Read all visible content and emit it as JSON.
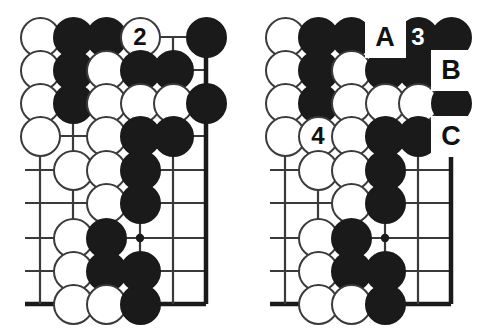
{
  "figure": {
    "type": "go-board-diagram",
    "diagram_count": 2,
    "colors": {
      "black_stone": "#1a1a1a",
      "white_stone": "#ffffff",
      "stone_outline": "#3b3b3b",
      "grid_line": "#3a3a3a",
      "edge_line": "#1a1a1a",
      "background": "#ffffff",
      "label_text": "#111111",
      "white_stone_number": "#111111",
      "black_stone_number": "#ffffff"
    },
    "geometry": {
      "columns": 6,
      "rows": 9,
      "col_x": [
        40,
        73,
        106,
        140,
        173,
        206
      ],
      "row_y": [
        37,
        70,
        103,
        136,
        170,
        203,
        238,
        271,
        304
      ],
      "stone_diameter": 41,
      "star_point": {
        "col": 4,
        "row": 7
      },
      "right_edge_col": 6,
      "bottom_edge_row": 9
    }
  },
  "boards": [
    {
      "name": "left-diagram",
      "stones": [
        {
          "col": 1,
          "row": 1,
          "color": "white",
          "label": ""
        },
        {
          "col": 2,
          "row": 1,
          "color": "black",
          "label": ""
        },
        {
          "col": 3,
          "row": 1,
          "color": "black",
          "label": ""
        },
        {
          "col": 4,
          "row": 1,
          "color": "white",
          "label": "2"
        },
        {
          "col": 6,
          "row": 1,
          "color": "black",
          "label": ""
        },
        {
          "col": 1,
          "row": 2,
          "color": "white",
          "label": ""
        },
        {
          "col": 2,
          "row": 2,
          "color": "black",
          "label": ""
        },
        {
          "col": 3,
          "row": 2,
          "color": "white",
          "label": ""
        },
        {
          "col": 4,
          "row": 2,
          "color": "black",
          "label": ""
        },
        {
          "col": 5,
          "row": 2,
          "color": "black",
          "label": ""
        },
        {
          "col": 1,
          "row": 3,
          "color": "white",
          "label": ""
        },
        {
          "col": 2,
          "row": 3,
          "color": "black",
          "label": ""
        },
        {
          "col": 3,
          "row": 3,
          "color": "white",
          "label": ""
        },
        {
          "col": 4,
          "row": 3,
          "color": "white",
          "label": ""
        },
        {
          "col": 5,
          "row": 3,
          "color": "white",
          "label": ""
        },
        {
          "col": 6,
          "row": 3,
          "color": "black",
          "label": ""
        },
        {
          "col": 1,
          "row": 4,
          "color": "white",
          "label": ""
        },
        {
          "col": 3,
          "row": 4,
          "color": "white",
          "label": ""
        },
        {
          "col": 4,
          "row": 4,
          "color": "black",
          "label": ""
        },
        {
          "col": 5,
          "row": 4,
          "color": "black",
          "label": ""
        },
        {
          "col": 2,
          "row": 5,
          "color": "white",
          "label": ""
        },
        {
          "col": 3,
          "row": 5,
          "color": "white",
          "label": ""
        },
        {
          "col": 4,
          "row": 5,
          "color": "black",
          "label": ""
        },
        {
          "col": 3,
          "row": 6,
          "color": "white",
          "label": ""
        },
        {
          "col": 4,
          "row": 6,
          "color": "black",
          "label": ""
        },
        {
          "col": 2,
          "row": 7,
          "color": "white",
          "label": ""
        },
        {
          "col": 3,
          "row": 7,
          "color": "black",
          "label": ""
        },
        {
          "col": 2,
          "row": 8,
          "color": "white",
          "label": ""
        },
        {
          "col": 3,
          "row": 8,
          "color": "black",
          "label": ""
        },
        {
          "col": 4,
          "row": 8,
          "color": "black",
          "label": ""
        },
        {
          "col": 2,
          "row": 9,
          "color": "white",
          "label": ""
        },
        {
          "col": 3,
          "row": 9,
          "color": "white",
          "label": ""
        },
        {
          "col": 4,
          "row": 9,
          "color": "black",
          "label": ""
        }
      ],
      "point_labels": []
    },
    {
      "name": "right-diagram",
      "stones": [
        {
          "col": 1,
          "row": 1,
          "color": "white",
          "label": ""
        },
        {
          "col": 2,
          "row": 1,
          "color": "black",
          "label": ""
        },
        {
          "col": 3,
          "row": 1,
          "color": "black",
          "label": ""
        },
        {
          "col": 5,
          "row": 1,
          "color": "black",
          "label": "3"
        },
        {
          "col": 6,
          "row": 1,
          "color": "black",
          "label": ""
        },
        {
          "col": 1,
          "row": 2,
          "color": "white",
          "label": ""
        },
        {
          "col": 2,
          "row": 2,
          "color": "black",
          "label": ""
        },
        {
          "col": 3,
          "row": 2,
          "color": "white",
          "label": ""
        },
        {
          "col": 4,
          "row": 2,
          "color": "black",
          "label": ""
        },
        {
          "col": 5,
          "row": 2,
          "color": "black",
          "label": ""
        },
        {
          "col": 1,
          "row": 3,
          "color": "white",
          "label": ""
        },
        {
          "col": 2,
          "row": 3,
          "color": "black",
          "label": ""
        },
        {
          "col": 3,
          "row": 3,
          "color": "white",
          "label": ""
        },
        {
          "col": 4,
          "row": 3,
          "color": "white",
          "label": ""
        },
        {
          "col": 5,
          "row": 3,
          "color": "white",
          "label": ""
        },
        {
          "col": 6,
          "row": 3,
          "color": "black",
          "label": ""
        },
        {
          "col": 1,
          "row": 4,
          "color": "white",
          "label": ""
        },
        {
          "col": 2,
          "row": 4,
          "color": "white",
          "label": "4"
        },
        {
          "col": 3,
          "row": 4,
          "color": "white",
          "label": ""
        },
        {
          "col": 4,
          "row": 4,
          "color": "black",
          "label": ""
        },
        {
          "col": 5,
          "row": 4,
          "color": "black",
          "label": ""
        },
        {
          "col": 2,
          "row": 5,
          "color": "white",
          "label": ""
        },
        {
          "col": 3,
          "row": 5,
          "color": "white",
          "label": ""
        },
        {
          "col": 4,
          "row": 5,
          "color": "black",
          "label": ""
        },
        {
          "col": 3,
          "row": 6,
          "color": "white",
          "label": ""
        },
        {
          "col": 4,
          "row": 6,
          "color": "black",
          "label": ""
        },
        {
          "col": 2,
          "row": 7,
          "color": "white",
          "label": ""
        },
        {
          "col": 3,
          "row": 7,
          "color": "black",
          "label": ""
        },
        {
          "col": 2,
          "row": 8,
          "color": "white",
          "label": ""
        },
        {
          "col": 3,
          "row": 8,
          "color": "black",
          "label": ""
        },
        {
          "col": 4,
          "row": 8,
          "color": "black",
          "label": ""
        },
        {
          "col": 2,
          "row": 9,
          "color": "white",
          "label": ""
        },
        {
          "col": 3,
          "row": 9,
          "color": "white",
          "label": ""
        },
        {
          "col": 4,
          "row": 9,
          "color": "black",
          "label": ""
        }
      ],
      "point_labels": [
        {
          "col": 4,
          "row": 1,
          "text": "A"
        },
        {
          "col": 6,
          "row": 2,
          "text": "B"
        },
        {
          "col": 6,
          "row": 4,
          "text": "C"
        }
      ]
    }
  ]
}
